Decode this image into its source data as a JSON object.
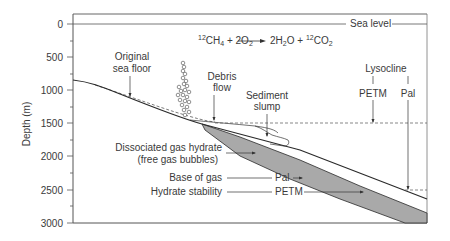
{
  "figure": {
    "type": "cross-section diagram",
    "y_axis": {
      "label": "Depth (m)",
      "ticks": [
        "0",
        "500",
        "1000",
        "1500",
        "2000",
        "2500",
        "3000"
      ],
      "range": [
        0,
        3000
      ]
    },
    "equation": {
      "lhs_1_sup": "12",
      "lhs_1": "CH",
      "lhs_1_sub": "4",
      "plus_1": " + 2O",
      "plus_1_sub": "2",
      "arrow": "⟶",
      "rhs_1": "2H",
      "rhs_1_sub": "2",
      "rhs_1b": "O + ",
      "rhs_2_sup": "12",
      "rhs_2": "CO",
      "rhs_2_sub": "2"
    },
    "labels": {
      "sea_level": "Sea level",
      "original_sea_floor_1": "Original",
      "original_sea_floor_2": "sea floor",
      "debris_flow_1": "Debris",
      "debris_flow_2": "flow",
      "sediment_slump_1": "Sediment",
      "sediment_slump_2": "slump",
      "lysocline": "Lysocline",
      "lysocline_petm": "PETM",
      "lysocline_pal": "Pal",
      "dissociated_1": "Dissociated gas hydrate",
      "dissociated_2": "(free gas bubbles)",
      "base_of_gas": "Base of gas",
      "base_of_gas_marker": "Pal",
      "hydrate_stability": "Hydrate stability",
      "hydrate_stability_marker": "PETM"
    },
    "colors": {
      "line": "#2a2a2a",
      "frame": "#555555",
      "hydrate_band": "#a9a9a9",
      "text": "#3a3a3a"
    }
  }
}
